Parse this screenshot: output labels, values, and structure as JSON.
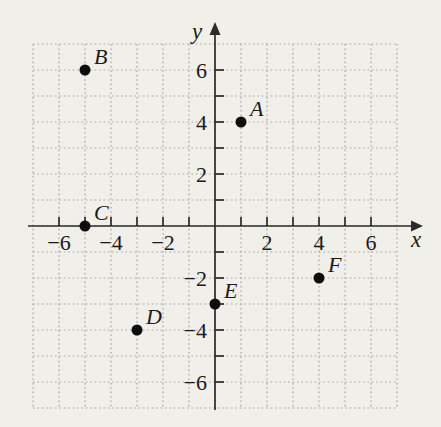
{
  "figure": {
    "background_color": "#f1efe9",
    "grid_color": "#a6a6a0",
    "axis_color": "#2b2b2b",
    "point_color": "#0d0d0d",
    "text_color": "#1a1a1a"
  },
  "chart_data": {
    "type": "scatter",
    "title": "",
    "xlabel": "x",
    "ylabel": "y",
    "xlim": [
      -7,
      7
    ],
    "ylim": [
      -7,
      7
    ],
    "tick_interval": 1,
    "tick_label_interval": 2,
    "grid": "dotted unit grid, on",
    "legend": "none",
    "points": [
      {
        "label": "A",
        "x": 1,
        "y": 4
      },
      {
        "label": "B",
        "x": -5,
        "y": 6
      },
      {
        "label": "C",
        "x": -5,
        "y": 0
      },
      {
        "label": "D",
        "x": -3,
        "y": -4
      },
      {
        "label": "E",
        "x": 0,
        "y": -3
      },
      {
        "label": "F",
        "x": 4,
        "y": -2
      }
    ],
    "x_tick_labels": [
      {
        "value": -6,
        "label": "−6"
      },
      {
        "value": -4,
        "label": "−4"
      },
      {
        "value": -2,
        "label": "−2"
      },
      {
        "value": 2,
        "label": "2"
      },
      {
        "value": 4,
        "label": "4"
      },
      {
        "value": 6,
        "label": "6"
      }
    ],
    "y_tick_labels": [
      {
        "value": 6,
        "label": "6"
      },
      {
        "value": 4,
        "label": "4"
      },
      {
        "value": 2,
        "label": "2"
      },
      {
        "value": -2,
        "label": "−2"
      },
      {
        "value": -4,
        "label": "−4"
      },
      {
        "value": -6,
        "label": "−6"
      }
    ]
  }
}
